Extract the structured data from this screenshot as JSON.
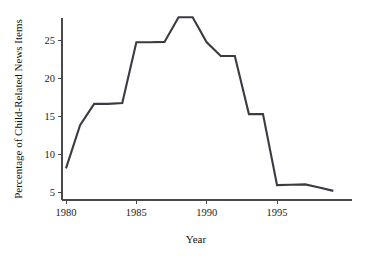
{
  "chart_data": {
    "type": "line",
    "title": "",
    "xlabel": "Year",
    "ylabel": "Percentage of Child-Related News Items",
    "xlim": [
      1979.0,
      1999.8
    ],
    "ylim": [
      4.2,
      29.2
    ],
    "xticks": [
      1980,
      1985,
      1990,
      1995
    ],
    "xtick_labels": [
      "1980",
      "1985",
      "1990",
      "1995"
    ],
    "yticks": [
      5,
      10,
      15,
      20,
      25
    ],
    "ytick_labels": [
      "5",
      "10",
      "15",
      "20",
      "25"
    ],
    "grid": false,
    "legend": "none",
    "line_color": "#3b3b42",
    "x": [
      1980,
      1981,
      1982,
      1983,
      1984,
      1985,
      1986,
      1987,
      1988,
      1989,
      1990,
      1991,
      1992,
      1993,
      1994,
      1995,
      1996,
      1997,
      1998,
      1999
    ],
    "values": [
      8.1,
      13.8,
      16.6,
      16.6,
      16.7,
      24.7,
      24.7,
      24.75,
      28.0,
      28.0,
      24.7,
      22.9,
      22.9,
      15.25,
      15.25,
      5.9,
      5.95,
      6.0,
      5.6,
      5.15
    ],
    "series": [
      {
        "name": "Percentage of Child-Related News Items",
        "values": [
          8.1,
          13.8,
          16.6,
          16.6,
          16.7,
          24.7,
          24.7,
          24.75,
          28.0,
          28.0,
          24.7,
          22.9,
          22.9,
          15.25,
          15.25,
          5.9,
          5.95,
          6.0,
          5.6,
          5.15
        ]
      }
    ]
  }
}
